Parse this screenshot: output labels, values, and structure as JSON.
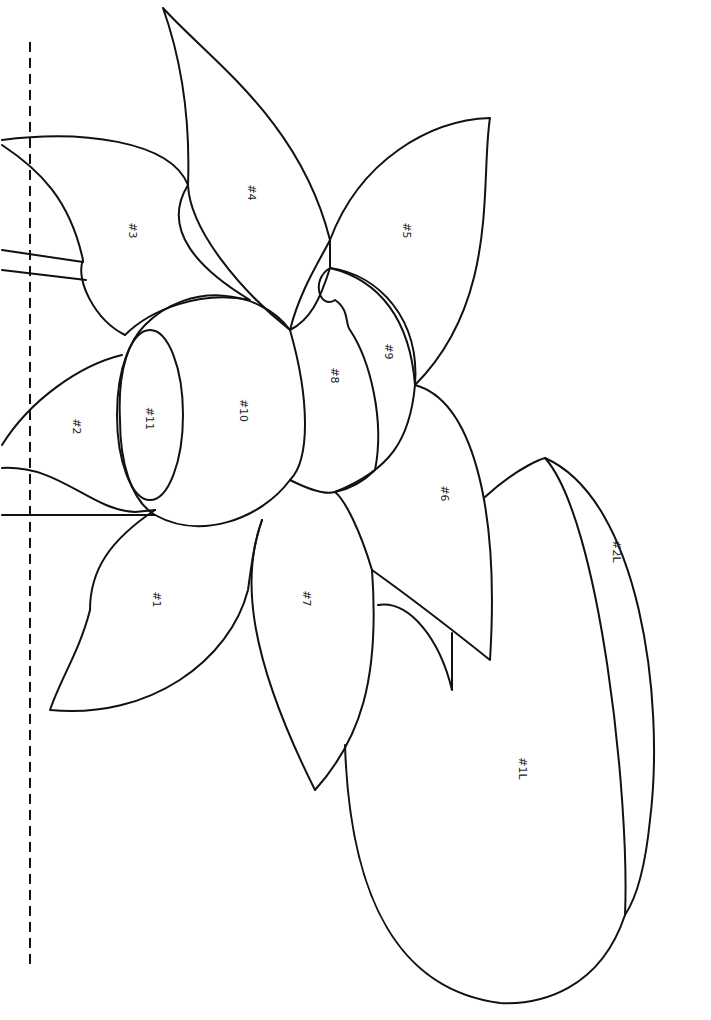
{
  "diagram": {
    "type": "line-art coloring pattern (lotus flower with lily pad), rotated 90°",
    "stroke_color": "#111111",
    "background": "#ffffff",
    "labels": {
      "p1": "#1",
      "p2": "#2",
      "p3": "#3",
      "p4": "#4",
      "p5": "#5",
      "p6": "#6",
      "p7": "#7",
      "p8": "#8",
      "p9": "#9",
      "p10": "#10",
      "p11": "#11",
      "l1": "#1L",
      "l2": "#2L"
    }
  }
}
